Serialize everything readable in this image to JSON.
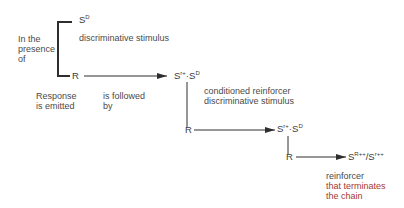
{
  "diagram": {
    "type": "behavior-chain",
    "nodes": {
      "sd": {
        "base": "S",
        "sup": "D"
      },
      "r1": {
        "label": "R"
      },
      "link1": {
        "base1": "S",
        "sup1": "r+",
        "dot": "·",
        "base2": "S",
        "sup2": "D"
      },
      "r2": {
        "label": "R"
      },
      "link2": {
        "base1": "S",
        "sup1": "r+",
        "dot": "·",
        "base2": "S",
        "sup2": "D"
      },
      "r3": {
        "label": "R"
      },
      "terminal": {
        "base1": "S",
        "sup1": "R++",
        "slash": "/",
        "base2": "S",
        "sup2": "r++"
      }
    },
    "labels": {
      "in_presence": [
        "In the",
        "presence",
        "of"
      ],
      "discriminative_stimulus": "discriminative stimulus",
      "response_emitted": [
        "Response",
        "is emitted"
      ],
      "is_followed_by": [
        "is followed",
        "by"
      ],
      "conditioned_reinforcer": [
        "conditioned reinforcer",
        "discriminative stimulus"
      ],
      "terminal_reinforcer": [
        "reinforcer",
        "that terminates"
      ],
      "terminal_reinforcer_red": "the chain"
    },
    "colors": {
      "line": "#2e2e2e",
      "text": "#4a4a4a",
      "accent_red": "#a8382e"
    }
  }
}
